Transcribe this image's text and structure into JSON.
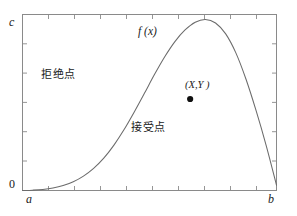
{
  "figure": {
    "type": "acceptance-rejection-sampling-diagram",
    "background_color": "#ffffff",
    "frame_color": "#8a8a8a",
    "curve_color": "#6b6b6b",
    "text_color": "#1a1a1a"
  },
  "axes": {
    "y_top_label": "c",
    "y_bottom_label": "0",
    "x_left_label": "a",
    "x_right_label": "b"
  },
  "labels": {
    "curve_name": "f (x)",
    "rejection_region": "拒绝点",
    "acceptance_region": "接受点",
    "sample_point": "(X,Y )"
  },
  "chart_data": {
    "type": "line",
    "title": "",
    "xlabel": "",
    "ylabel": "",
    "xlim": [
      0,
      1
    ],
    "ylim": [
      0,
      1
    ],
    "xtick_labels": [
      "a",
      "b"
    ],
    "ytick_labels": [
      "0",
      "c"
    ],
    "grid": false,
    "legend": "none",
    "annotations": [
      {
        "text": "f (x)",
        "x": 0.46,
        "y": 0.93,
        "kind": "curve-label"
      },
      {
        "text": "拒绝点",
        "x": 0.12,
        "y": 0.69,
        "kind": "region-label"
      },
      {
        "text": "接受点",
        "x": 0.46,
        "y": 0.38,
        "kind": "region-label"
      },
      {
        "text": "(X,Y )",
        "x": 0.68,
        "y": 0.59,
        "kind": "point-label"
      }
    ],
    "marker_points": [
      {
        "name": "sample-point",
        "x": 0.66,
        "y": 0.52,
        "marker": "filled-circle"
      }
    ],
    "series": [
      {
        "name": "f (x)",
        "x": [
          0.0,
          0.04,
          0.08,
          0.12,
          0.16,
          0.2,
          0.24,
          0.28,
          0.32,
          0.36,
          0.4,
          0.44,
          0.48,
          0.52,
          0.56,
          0.6,
          0.64,
          0.68,
          0.72,
          0.76,
          0.8,
          0.84,
          0.88,
          0.92,
          0.96,
          1.0
        ],
        "y": [
          0.0,
          0.002,
          0.006,
          0.014,
          0.028,
          0.05,
          0.082,
          0.126,
          0.184,
          0.258,
          0.346,
          0.446,
          0.552,
          0.66,
          0.76,
          0.846,
          0.912,
          0.956,
          0.972,
          0.952,
          0.89,
          0.782,
          0.632,
          0.452,
          0.252,
          0.03
        ]
      }
    ]
  }
}
